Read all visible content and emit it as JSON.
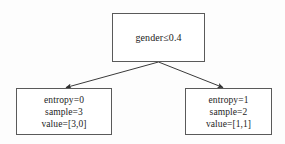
{
  "diagram": {
    "type": "decision-tree",
    "title": "",
    "colors": {
      "background": "#fdfdfd",
      "node_fill": "#ffffff",
      "node_border": "#5a5a5a",
      "edge": "#3a3a3a",
      "text": "#1c1c1c"
    },
    "root": {
      "id": "root",
      "lines": [
        "gender≤0.4"
      ]
    },
    "children": [
      {
        "id": "left-leaf",
        "branch": "true",
        "lines": [
          "entropy=0",
          "sample=3",
          "value=[3,0]"
        ]
      },
      {
        "id": "right-leaf",
        "branch": "false",
        "lines": [
          "entropy=1",
          "sample=2",
          "value=[1,1]"
        ]
      }
    ],
    "edges": [
      {
        "from": "root",
        "to": "left-leaf",
        "label": ""
      },
      {
        "from": "root",
        "to": "right-leaf",
        "label": ""
      }
    ]
  }
}
